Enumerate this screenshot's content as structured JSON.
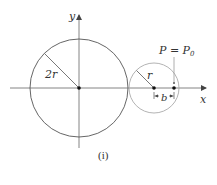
{
  "diagram": {
    "caption": "(i)",
    "axes": {
      "x_label": "x",
      "y_label": "y"
    },
    "large_circle": {
      "radius_label": "2r",
      "center": [
        79,
        88
      ],
      "radius_px": 49
    },
    "small_circle": {
      "radius_label": "r",
      "center": [
        154,
        88
      ],
      "radius_px": 25
    },
    "point": {
      "label": "P = P",
      "subscript": "0",
      "offset_label": "b"
    },
    "colors": {
      "large_circle": "#555555",
      "small_circle": "#aaaaaa",
      "axes": "#666666",
      "text": "#333333"
    }
  }
}
